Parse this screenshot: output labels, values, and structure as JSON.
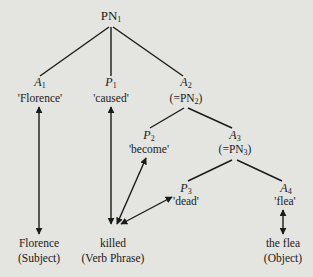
{
  "diagram": {
    "root": {
      "label": "PN",
      "sub": "1"
    },
    "nodes": [
      {
        "id": "A1",
        "label": "A",
        "sub": "1",
        "gloss": "'Florence'"
      },
      {
        "id": "P1",
        "label": "P",
        "sub": "1",
        "gloss": "'caused'"
      },
      {
        "id": "A2",
        "label": "A",
        "sub": "2",
        "gloss": "(=PN",
        "gloss_sub": "2",
        "gloss_end": ")"
      },
      {
        "id": "P2",
        "label": "P",
        "sub": "2",
        "gloss": "'become'"
      },
      {
        "id": "A3",
        "label": "A",
        "sub": "3",
        "gloss": "(=PN",
        "gloss_sub": "3",
        "gloss_end": ")"
      },
      {
        "id": "P3",
        "label": "P",
        "sub": "3",
        "gloss": "'dead'"
      },
      {
        "id": "A4",
        "label": "A",
        "sub": "4",
        "gloss": "'flea'"
      }
    ],
    "edges": [
      [
        "PN1",
        "A1"
      ],
      [
        "PN1",
        "P1"
      ],
      [
        "PN1",
        "A2"
      ],
      [
        "A2",
        "P2"
      ],
      [
        "A2",
        "A3"
      ],
      [
        "A3",
        "P3"
      ],
      [
        "A3",
        "A4"
      ]
    ],
    "surface": [
      {
        "id": "florence",
        "word": "Florence",
        "role": "(Subject)"
      },
      {
        "id": "killed",
        "word": "killed",
        "role": "(Verb Phrase)"
      },
      {
        "id": "flea",
        "word": "the flea",
        "role": "(Object)"
      }
    ],
    "mappings": [
      [
        "A1",
        "florence"
      ],
      [
        "P1",
        "killed"
      ],
      [
        "P2",
        "killed"
      ],
      [
        "P3",
        "killed"
      ],
      [
        "A4",
        "flea"
      ]
    ]
  }
}
